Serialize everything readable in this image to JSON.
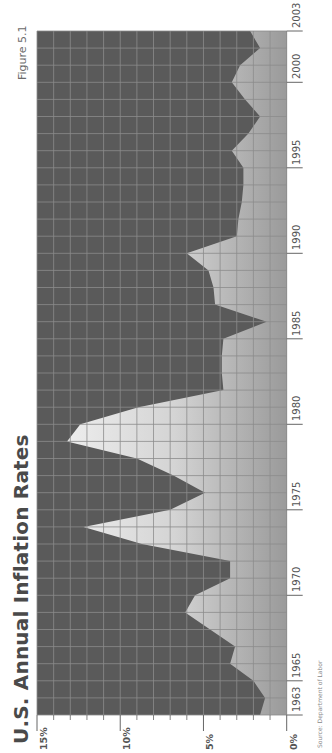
{
  "figure_label": "Figure 5.1",
  "title": "U.S. Annual Inflation Rates",
  "source": "Source: Department of Labor",
  "y_axis_ticks": [
    "15%",
    "10%",
    "5%",
    "0%"
  ],
  "x_axis_ticks": [
    "1963",
    "1965",
    "1970",
    "1975",
    "1980",
    "1985",
    "1990",
    "1995",
    "2000",
    "2003"
  ],
  "colors": {
    "background": "#5a5a5a",
    "grid": "#8c8c8c",
    "fill_high": "#f4f4f4",
    "fill_low": "#9a9a9a"
  },
  "chart_data": {
    "type": "area",
    "title": "U.S. Annual Inflation Rates",
    "subtitle": "Figure 5.1",
    "xlabel": "",
    "ylabel": "",
    "orientation": "rotated 90° (years run bottom-to-top, percent runs right-to-left)",
    "ylim": [
      0,
      15
    ],
    "xlim": [
      1963,
      2003
    ],
    "grid": true,
    "legend": null,
    "source": "Source: Department of Labor",
    "x": [
      1963,
      1964,
      1965,
      1966,
      1967,
      1968,
      1969,
      1970,
      1971,
      1972,
      1973,
      1974,
      1975,
      1976,
      1977,
      1978,
      1979,
      1980,
      1981,
      1982,
      1983,
      1984,
      1985,
      1986,
      1987,
      1988,
      1989,
      1990,
      1991,
      1992,
      1993,
      1994,
      1995,
      1996,
      1997,
      1998,
      1999,
      2000,
      2001,
      2002,
      2003
    ],
    "series": [
      {
        "name": "Inflation rate (%)",
        "values": [
          1.6,
          1.3,
          2.0,
          3.4,
          3.1,
          4.6,
          6.1,
          5.5,
          3.4,
          3.4,
          8.7,
          12.2,
          7.0,
          4.9,
          6.8,
          9.0,
          13.2,
          12.4,
          8.9,
          3.8,
          3.9,
          3.9,
          3.8,
          1.2,
          4.3,
          4.4,
          4.7,
          6.0,
          3.0,
          2.9,
          2.7,
          2.6,
          2.6,
          3.3,
          2.3,
          1.6,
          2.5,
          3.3,
          2.8,
          1.6,
          2.2
        ]
      }
    ]
  }
}
